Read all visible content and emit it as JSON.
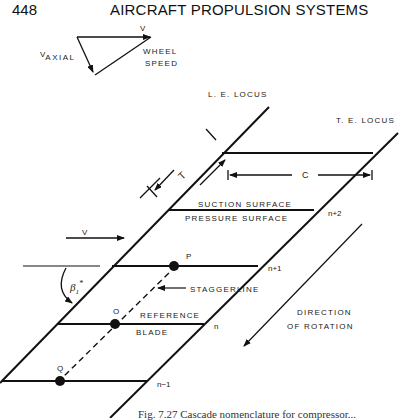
{
  "header": {
    "page_number": "448",
    "running_title": "AIRCRAFT PROPULSION SYSTEMS"
  },
  "velocity_triangle": {
    "v_label": "V",
    "v_axial_prefix": "V",
    "v_axial_sub": "AXIAL",
    "wheel_speed_line1": "WHEEL",
    "wheel_speed_line2": "SPEED"
  },
  "cascade": {
    "le_locus": "L. E. LOCUS",
    "te_locus": "T. E. LOCUS",
    "spacing_label": "T",
    "chord_label": "C",
    "suction_surface": "SUCTION SURFACE",
    "pressure_surface": "PRESSURE SURFACE",
    "inlet_velocity": "V",
    "angle_label": "β",
    "angle_sub": "1",
    "angle_sup": "*",
    "staggerline": "STAGGERLINE",
    "reference_blade_line1": "REFERENCE",
    "reference_blade_line2": "BLADE",
    "points": [
      "P",
      "O",
      "Q"
    ],
    "blade_indices": [
      "n+2",
      "n+1",
      "n",
      "n−1"
    ],
    "direction_line1": "DIRECTION",
    "direction_line2": "OF ROTATION"
  },
  "caption": "Fig. 7.27   Cascade nomenclature for compressor..."
}
